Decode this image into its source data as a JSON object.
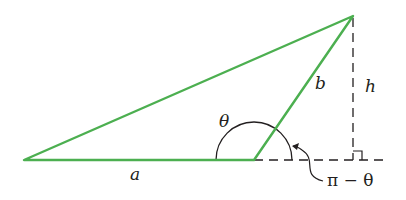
{
  "diagram": {
    "type": "triangle-height-construction",
    "colors": {
      "triangle": "#4caf50",
      "construction": "#231f20"
    },
    "vertices": {
      "left": [
        24,
        160
      ],
      "middle": [
        254,
        160
      ],
      "apex": [
        353,
        16
      ]
    },
    "labels": {
      "side_a": "a",
      "side_b": "b",
      "height": "h",
      "angle": "θ",
      "supplement": "π − θ"
    }
  }
}
